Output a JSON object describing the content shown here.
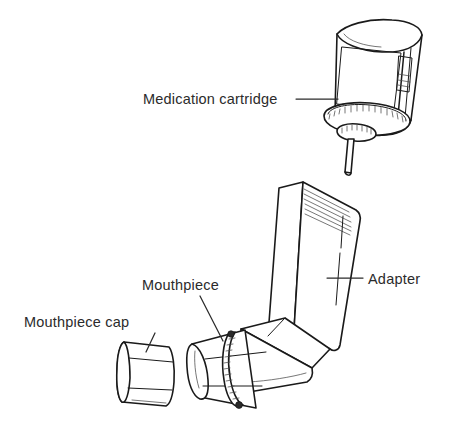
{
  "figure": {
    "background_color": "#ffffff",
    "ink_color": "#1a1a1a",
    "width": 452,
    "height": 427
  },
  "callouts": [
    {
      "id": "medication-cartridge",
      "label": "Medication cartridge",
      "text_x": 143,
      "text_y": 104,
      "leader": "M 296 99 L 338 99",
      "anchor": "start"
    },
    {
      "id": "adapter",
      "label": "Adapter",
      "text_x": 368,
      "text_y": 284,
      "leader": "M 363 278 L 327 278",
      "anchor": "start"
    },
    {
      "id": "mouthpiece",
      "label": "Mouthpiece",
      "text_x": 142,
      "text_y": 290,
      "leader": "M 200 296 L 223 341",
      "anchor": "start"
    },
    {
      "id": "mouthpiece-cap",
      "label": "Mouthpiece cap",
      "text_x": 24,
      "text_y": 327,
      "leader": "M 155 333 L 146 352",
      "anchor": "start"
    }
  ],
  "parts": [
    {
      "id": "medication-cartridge",
      "name": "Medication cartridge",
      "shape": "tilted cylindrical canister with knurled collar and valve stem"
    },
    {
      "id": "adapter",
      "name": "Adapter",
      "shape": "L-shaped actuator boot"
    },
    {
      "id": "mouthpiece",
      "name": "Mouthpiece",
      "shape": "open tube with ribbed collar band"
    },
    {
      "id": "mouthpiece-cap",
      "name": "Mouthpiece cap",
      "shape": "short detached cylinder cover"
    }
  ]
}
